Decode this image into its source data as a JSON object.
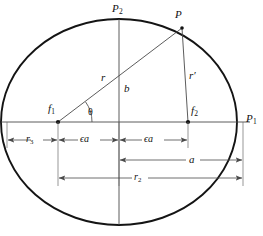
{
  "figure": {
    "type": "geometry-diagram",
    "width": 263,
    "height": 236,
    "background_color": "#ffffff",
    "stroke_color": "#1a1a1a",
    "thin_stroke_color": "#555555"
  },
  "geometry": {
    "ellipse": {
      "cx": 119,
      "cy": 122,
      "rx": 118,
      "ry": 103
    },
    "focus_left": {
      "x": 58,
      "y": 122
    },
    "focus_right": {
      "x": 188,
      "y": 122
    },
    "point_p": {
      "x": 182,
      "y": 28
    },
    "point_p2_top": {
      "x": 119,
      "y": 19
    },
    "point_p1_right": {
      "x": 243,
      "y": 122
    },
    "major_axis_y": 122,
    "minor_axis_x": 119
  },
  "labels": {
    "p_top": "P",
    "p_top_sub": "2",
    "p_point": "P",
    "p_right": "P",
    "p_right_sub": "1",
    "focus_left": "f",
    "focus_left_sub": "1",
    "focus_right": "f",
    "focus_right_sub": "2",
    "radius_r": "r",
    "radius_r_prime": "r′",
    "semi_minor_b": "b",
    "angle_theta": "θ",
    "dim_r3": "r",
    "dim_r3_sub": "3",
    "dim_eps_a_left": "ϵa",
    "dim_eps_a_right": "ϵa",
    "dim_a": "a",
    "dim_r2": "r",
    "dim_r2_sub": "2"
  },
  "dimensions": {
    "rows": [
      {
        "name": "r3",
        "y": 140,
        "from_x": 7,
        "to_x": 58,
        "label": "r₃"
      },
      {
        "name": "epsilon-a-left",
        "y": 140,
        "from_x": 58,
        "to_x": 119,
        "label": "ϵa"
      },
      {
        "name": "epsilon-a-right",
        "y": 140,
        "from_x": 119,
        "to_x": 188,
        "label": "ϵa"
      },
      {
        "name": "a",
        "y": 160,
        "from_x": 119,
        "to_x": 243,
        "label": "a"
      },
      {
        "name": "r2",
        "y": 178,
        "from_x": 58,
        "to_x": 243,
        "label": "r₂"
      }
    ]
  }
}
